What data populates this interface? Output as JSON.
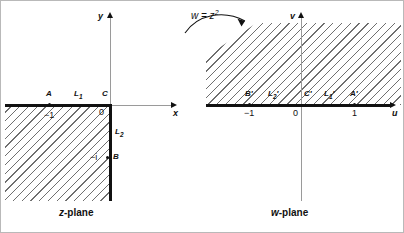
{
  "figure": {
    "mapping_label": "w = z",
    "mapping_exponent": "2",
    "arrow_icon": "curved-arrow-right"
  },
  "z_plane": {
    "caption_var": "z",
    "caption_rest": "-plane",
    "axis_x": "x",
    "axis_y": "y",
    "origin_label": "0",
    "points": [
      {
        "name": "A",
        "label": "A",
        "value": "−1"
      },
      {
        "name": "B",
        "label": "B",
        "value": "−i"
      },
      {
        "name": "C",
        "label": "C",
        "value": "0"
      }
    ],
    "segments": [
      {
        "name": "L1",
        "base": "L",
        "sub": "1"
      },
      {
        "name": "L2",
        "base": "L",
        "sub": "2"
      }
    ],
    "tick_minus_one": "−1",
    "tick_minus_i": "−i",
    "region_description": "shaded third quadrant"
  },
  "w_plane": {
    "caption_var": "w",
    "caption_rest": "-plane",
    "axis_u": "u",
    "axis_v": "v",
    "origin_label": "0",
    "points": [
      {
        "name": "A-prime",
        "label": "A′",
        "value": "1"
      },
      {
        "name": "B-prime",
        "label": "B′",
        "value": "−1"
      },
      {
        "name": "C-prime",
        "label": "C′",
        "value": "0"
      }
    ],
    "segments": [
      {
        "name": "L1-prime",
        "base": "L",
        "sub": "1",
        "prime": "′"
      },
      {
        "name": "L2-prime",
        "base": "L",
        "sub": "2",
        "prime": "′"
      }
    ],
    "ticks": [
      "−1",
      "0",
      "1"
    ],
    "region_description": "shaded upper half plane"
  },
  "colors": {
    "ink": "#111111",
    "axis_gray": "#9a9a9a",
    "hatch": "#6f6f6f",
    "frame": "#b9b9b9"
  }
}
